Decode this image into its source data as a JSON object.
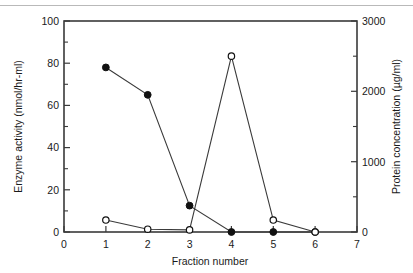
{
  "figure": {
    "background_color": "#ffffff",
    "line_color": "#3a3a3a",
    "text_color": "#1a1a1a",
    "top_rule_color": "#b9b9b9"
  },
  "chart_data": {
    "type": "line",
    "title": "",
    "subtitle": "",
    "xlabel": "Fraction number",
    "ylabel": "Enzyme activity (nmol/hr-ml)",
    "y2label": "Protein concentration (µg/ml)",
    "xlim": [
      0,
      7
    ],
    "ylim": [
      0,
      100
    ],
    "y2lim": [
      0,
      3000
    ],
    "xticks": [
      0,
      1,
      2,
      3,
      4,
      5,
      6,
      7
    ],
    "xticklabels": [
      "0",
      "1",
      "2",
      "3",
      "4",
      "5",
      "6",
      "7"
    ],
    "yticks": [
      0,
      20,
      40,
      60,
      80,
      100
    ],
    "yticklabels": [
      "0",
      "20",
      "40",
      "60",
      "80",
      "100"
    ],
    "yminorticks": [
      10,
      30,
      50,
      70,
      90
    ],
    "y2ticks": [
      0,
      1000,
      2000,
      3000
    ],
    "y2ticklabels": [
      "0",
      "1000",
      "2000",
      "3000"
    ],
    "y2minorticks": [
      500,
      1500,
      2500
    ],
    "grid": false,
    "legend": "none",
    "x": [
      1,
      2,
      3,
      4,
      5,
      6
    ],
    "series": [
      {
        "name": "Enzyme activity",
        "axis": "left",
        "marker": "filled-circle",
        "values": [
          78,
          65,
          12.5,
          0,
          0,
          0
        ]
      },
      {
        "name": "Protein concentration",
        "axis": "right",
        "marker": "open-circle",
        "values": [
          170,
          40,
          30,
          2500,
          170,
          0
        ]
      }
    ]
  }
}
